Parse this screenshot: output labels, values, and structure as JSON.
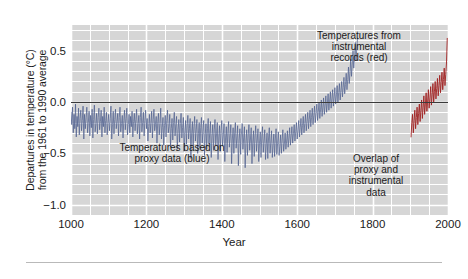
{
  "chart_data": {
    "type": "line",
    "title": "",
    "xlabel": "Year",
    "ylabel_line1": "Departures in temperature (°C)",
    "ylabel_line2": "from the 1961 to 1990 average",
    "xlim": [
      1000,
      2000
    ],
    "ylim": [
      -1.1,
      0.75
    ],
    "xticks": [
      1000,
      1200,
      1400,
      1600,
      1800,
      2000
    ],
    "xticklabels": [
      "1000",
      "1200",
      "1400",
      "1600",
      "1800",
      "2000"
    ],
    "yticks": [
      0.5,
      0.0,
      -0.5,
      -1.0
    ],
    "yticklabels": [
      "0.5",
      "0.0",
      "-0.5",
      "-1.0"
    ],
    "grid": true,
    "grid_x_step": 50,
    "grid_y_step": 0.1,
    "grid_color": "#ffffff",
    "plot_background": "#d6d6d6",
    "zero_line": 0.0,
    "zero_line_color": "#3a3a3a",
    "legend_position": "none",
    "annotations": [
      {
        "name": "proxy-annotation",
        "text": "Temperatures based on\nproxy data (blue)",
        "x": 1310,
        "y": -0.52
      },
      {
        "name": "instrumental-annotation",
        "text": "Temperatures from\ninstrumental\nrecords (red)",
        "x": 1830,
        "y": 0.66
      },
      {
        "name": "overlap-annotation",
        "text": "Overlap of\nproxy and\ninstrumental\ndata",
        "x": 1900,
        "y": -0.58
      }
    ],
    "series": [
      {
        "name": "Temperatures based on proxy data",
        "color": "#4a5c8c",
        "linewidth": 0.7,
        "x_start": 1000,
        "x_end": 1980,
        "x_step": 2,
        "description": "Annual proxy reconstruction, noisy around a slowly declining baseline from about -0.15 °C near 1000 to about -0.35 °C near 1900, then rising sharply.",
        "values": [
          -0.1,
          -0.22,
          -0.05,
          -0.3,
          -0.12,
          -0.26,
          -0.02,
          -0.34,
          -0.14,
          -0.24,
          -0.06,
          -0.32,
          -0.16,
          -0.08,
          -0.28,
          -0.18,
          -0.04,
          -0.36,
          -0.12,
          -0.26,
          -0.15,
          -0.05,
          -0.3,
          -0.2,
          -0.09,
          -0.33,
          -0.13,
          -0.25,
          -0.07,
          -0.35,
          -0.17,
          -0.03,
          -0.29,
          -0.21,
          -0.11,
          -0.31,
          -0.15,
          -0.06,
          -0.27,
          -0.19,
          -0.08,
          -0.34,
          -0.14,
          -0.24,
          -0.05,
          -0.3,
          -0.18,
          -0.1,
          -0.32,
          -0.2,
          -0.12,
          -0.28,
          -0.16,
          -0.04,
          -0.36,
          -0.22,
          -0.09,
          -0.31,
          -0.17,
          -0.07,
          -0.26,
          -0.19,
          -0.11,
          -0.33,
          -0.15,
          -0.05,
          -0.29,
          -0.21,
          -0.13,
          -0.35,
          -0.18,
          -0.08,
          -0.27,
          -0.16,
          -0.06,
          -0.32,
          -0.22,
          -0.12,
          -0.3,
          -0.14,
          -0.24,
          -0.09,
          -0.34,
          -0.19,
          -0.11,
          -0.28,
          -0.17,
          -0.07,
          -0.31,
          -0.21,
          -0.13,
          -0.36,
          -0.15,
          -0.05,
          -0.29,
          -0.2,
          -0.1,
          -0.33,
          -0.18,
          -0.08,
          -0.26,
          -0.16,
          -0.38,
          -0.24,
          -0.12,
          -0.3,
          -0.2,
          -0.09,
          -0.35,
          -0.17,
          -0.07,
          -0.28,
          -0.22,
          -0.14,
          -0.4,
          -0.19,
          -0.11,
          -0.32,
          -0.21,
          -0.06,
          -0.36,
          -0.25,
          -0.15,
          -0.42,
          -0.23,
          -0.13,
          -0.34,
          -0.18,
          -0.08,
          -0.3,
          -0.24,
          -0.12,
          -0.44,
          -0.26,
          -0.16,
          -0.37,
          -0.2,
          -0.1,
          -0.33,
          -0.22,
          -0.14,
          -0.46,
          -0.27,
          -0.17,
          -0.39,
          -0.21,
          -0.11,
          -0.35,
          -0.25,
          -0.15,
          -0.48,
          -0.28,
          -0.18,
          -0.41,
          -0.23,
          -0.13,
          -0.36,
          -0.26,
          -0.16,
          -0.55,
          -0.3,
          -0.19,
          -0.43,
          -0.24,
          -0.14,
          -0.38,
          -0.27,
          -0.17,
          -0.5,
          -0.31,
          -0.2,
          -0.45,
          -0.25,
          -0.15,
          -0.4,
          -0.29,
          -0.18,
          -0.52,
          -0.32,
          -0.21,
          -0.46,
          -0.26,
          -0.16,
          -0.41,
          -0.3,
          -0.19,
          -0.54,
          -0.33,
          -0.22,
          -0.47,
          -0.27,
          -0.17,
          -0.42,
          -0.31,
          -0.2,
          -0.56,
          -0.34,
          -0.23,
          -0.48,
          -0.28,
          -0.18,
          -0.43,
          -0.32,
          -0.21,
          -0.58,
          -0.35,
          -0.24,
          -0.49,
          -0.29,
          -0.19,
          -0.44,
          -0.33,
          -0.22,
          -0.6,
          -0.36,
          -0.25,
          -0.5,
          -0.3,
          -0.2,
          -0.45,
          -0.34,
          -0.23,
          -0.62,
          -0.37,
          -0.26,
          -0.51,
          -0.31,
          -0.21,
          -0.46,
          -0.35,
          -0.24,
          -0.64,
          -0.38,
          -0.27,
          -0.52,
          -0.32,
          -0.22,
          -0.47,
          -0.36,
          -0.25,
          -0.6,
          -0.39,
          -0.28,
          -0.53,
          -0.33,
          -0.23,
          -0.48,
          -0.37,
          -0.26,
          -0.58,
          -0.4,
          -0.29,
          -0.54,
          -0.34,
          -0.24,
          -0.49,
          -0.38,
          -0.27,
          -0.56,
          -0.41,
          -0.3,
          -0.55,
          -0.35,
          -0.25,
          -0.5,
          -0.39,
          -0.28,
          -0.54,
          -0.42,
          -0.31,
          -0.53,
          -0.36,
          -0.26,
          -0.51,
          -0.4,
          -0.29,
          -0.52,
          -0.43,
          -0.32,
          -0.5,
          -0.37,
          -0.27,
          -0.48,
          -0.41,
          -0.3,
          -0.46,
          -0.38,
          -0.28,
          -0.44,
          -0.35,
          -0.25,
          -0.42,
          -0.33,
          -0.24,
          -0.4,
          -0.31,
          -0.22,
          -0.38,
          -0.29,
          -0.2,
          -0.36,
          -0.27,
          -0.18,
          -0.34,
          -0.25,
          -0.16,
          -0.32,
          -0.23,
          -0.14,
          -0.3,
          -0.21,
          -0.12,
          -0.28,
          -0.19,
          -0.1,
          -0.26,
          -0.17,
          -0.08,
          -0.24,
          -0.15,
          -0.06,
          -0.22,
          -0.13,
          -0.04,
          -0.2,
          -0.11,
          -0.02,
          -0.18,
          -0.09,
          0.0,
          -0.16,
          -0.07,
          0.02,
          -0.14,
          -0.05,
          0.04,
          -0.12,
          -0.03,
          0.06,
          -0.1,
          -0.01,
          0.08,
          -0.08,
          0.01,
          0.1,
          -0.06,
          0.03,
          0.12,
          -0.04,
          0.05,
          0.14,
          -0.02,
          0.07,
          0.16,
          0.0,
          0.09,
          0.18,
          0.02,
          0.11,
          0.2,
          0.05,
          0.14,
          0.24,
          0.08,
          0.17,
          0.28,
          0.12,
          0.22,
          0.34,
          0.18,
          0.28,
          0.42,
          0.25,
          0.36,
          0.5,
          0.33,
          0.44,
          0.58,
          0.4,
          0.52,
          0.62
        ]
      },
      {
        "name": "Temperatures from instrumental records",
        "color": "#a02020",
        "linewidth": 0.9,
        "x_start": 1902,
        "x_end": 1998,
        "x_step": 2,
        "description": "Instrumental record overlapping the proxy series from about 1900 to 1998, rising from about -0.35 °C to about +0.62 °C.",
        "values": [
          -0.34,
          -0.2,
          -0.12,
          -0.3,
          -0.18,
          -0.08,
          -0.26,
          -0.15,
          -0.05,
          -0.22,
          -0.11,
          -0.02,
          -0.19,
          -0.08,
          0.02,
          -0.16,
          -0.05,
          0.06,
          -0.12,
          -0.02,
          0.09,
          -0.09,
          0.01,
          0.12,
          -0.06,
          0.04,
          0.15,
          -0.03,
          0.07,
          0.18,
          0.0,
          0.1,
          0.2,
          0.03,
          0.13,
          0.23,
          0.06,
          0.16,
          0.26,
          0.09,
          0.19,
          0.29,
          0.12,
          0.22,
          0.33,
          0.16,
          0.27,
          0.38,
          0.62
        ]
      }
    ]
  },
  "figure": {
    "footer_rule": true
  }
}
